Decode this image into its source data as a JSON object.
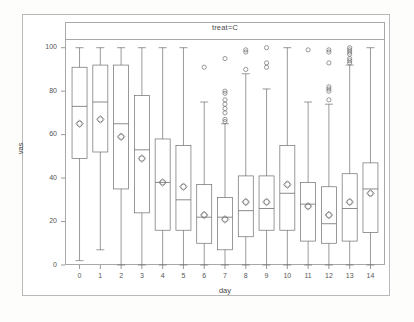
{
  "chart_data": {
    "type": "box",
    "title": "treat=C",
    "xlabel": "day",
    "ylabel": "vas",
    "xlim": [
      -0.7,
      14.7
    ],
    "ylim": [
      0,
      104
    ],
    "yticks": [
      0,
      20,
      40,
      60,
      80,
      100
    ],
    "xticks": [
      "0",
      "1",
      "2",
      "3",
      "4",
      "5",
      "6",
      "7",
      "8",
      "9",
      "10",
      "11",
      "12",
      "13",
      "14"
    ],
    "grid": false,
    "legend": null,
    "mean_marker": "diamond-with-circle",
    "categories": [
      "0",
      "1",
      "2",
      "3",
      "4",
      "5",
      "6",
      "7",
      "8",
      "9",
      "10",
      "11",
      "12",
      "13",
      "14"
    ],
    "boxes": [
      {
        "day": "0",
        "whisker_low": 2,
        "q1": 49,
        "median": 73,
        "mean": 65,
        "q3": 91,
        "whisker_high": 100,
        "outliers": []
      },
      {
        "day": "1",
        "whisker_low": 7,
        "q1": 52,
        "median": 75,
        "mean": 67,
        "q3": 92,
        "whisker_high": 100,
        "outliers": []
      },
      {
        "day": "2",
        "whisker_low": 0,
        "q1": 35,
        "median": 65,
        "mean": 59,
        "q3": 92,
        "whisker_high": 100,
        "outliers": []
      },
      {
        "day": "3",
        "whisker_low": 0,
        "q1": 24,
        "median": 53,
        "mean": 49,
        "q3": 78,
        "whisker_high": 100,
        "outliers": []
      },
      {
        "day": "4",
        "whisker_low": 0,
        "q1": 16,
        "median": 38,
        "mean": 38,
        "q3": 58,
        "whisker_high": 100,
        "outliers": []
      },
      {
        "day": "5",
        "whisker_low": 0,
        "q1": 16,
        "median": 30,
        "mean": 36,
        "q3": 55,
        "whisker_high": 100,
        "outliers": []
      },
      {
        "day": "6",
        "whisker_low": 0,
        "q1": 10,
        "median": 22,
        "mean": 23,
        "q3": 37,
        "whisker_high": 75,
        "outliers": [
          91
        ]
      },
      {
        "day": "7",
        "whisker_low": 0,
        "q1": 7,
        "median": 22,
        "mean": 21,
        "q3": 31,
        "whisker_high": 65,
        "outliers": [
          95,
          80,
          79,
          76,
          74,
          72,
          70,
          67,
          66
        ]
      },
      {
        "day": "8",
        "whisker_low": 0,
        "q1": 13,
        "median": 25,
        "mean": 29,
        "q3": 41,
        "whisker_high": 88,
        "outliers": [
          99,
          98,
          90
        ]
      },
      {
        "day": "9",
        "whisker_low": 0,
        "q1": 16,
        "median": 26,
        "mean": 29,
        "q3": 41,
        "whisker_high": 81,
        "outliers": [
          100,
          93,
          91
        ]
      },
      {
        "day": "10",
        "whisker_low": 0,
        "q1": 16,
        "median": 33,
        "mean": 37,
        "q3": 55,
        "whisker_high": 100,
        "outliers": []
      },
      {
        "day": "11",
        "whisker_low": 0,
        "q1": 11,
        "median": 28,
        "mean": 27,
        "q3": 38,
        "whisker_high": 75,
        "outliers": [
          99
        ]
      },
      {
        "day": "12",
        "whisker_low": 0,
        "q1": 10,
        "median": 19,
        "mean": 23,
        "q3": 36,
        "whisker_high": 74,
        "outliers": [
          99,
          98,
          93,
          82,
          81,
          80,
          76
        ]
      },
      {
        "day": "13",
        "whisker_low": 0,
        "q1": 11,
        "median": 26,
        "mean": 29,
        "q3": 42,
        "whisker_high": 92,
        "outliers": [
          100,
          99,
          98,
          97,
          95,
          94,
          93
        ]
      },
      {
        "day": "14",
        "whisker_low": 0,
        "q1": 15,
        "median": 35,
        "mean": 33,
        "q3": 47,
        "whisker_high": 100,
        "outliers": []
      }
    ],
    "colors": {
      "line": "#6e6e6e",
      "frame": "#a8a8a8",
      "text": "#565656",
      "background": "#ffffff"
    }
  }
}
